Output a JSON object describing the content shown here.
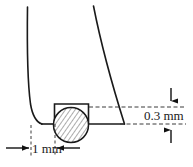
{
  "diagram": {
    "background_color": "#ffffff",
    "line_color": "#1a1a1a",
    "dashed_color": "#3a3a3a",
    "hatch_color": "#555555",
    "labels": {
      "horizontal_dimension": "1 mm",
      "vertical_dimension": "0.3 mm"
    },
    "parts": {
      "left_wall_name": "left-channel-wall",
      "right_wall_name": "right-channel-wall",
      "floor_left_name": "channel-floor-left",
      "floor_right_name": "channel-floor-right",
      "recess_name": "rectangular-recess",
      "circle_name": "hatched-circular-element"
    },
    "geometry": {
      "circle_center_x": 71,
      "circle_center_y": 125,
      "circle_radius": 18,
      "recess_left": 54,
      "recess_right": 89,
      "recess_top": 104,
      "baseline_y": 124,
      "upper_dash_y": 107
    }
  }
}
